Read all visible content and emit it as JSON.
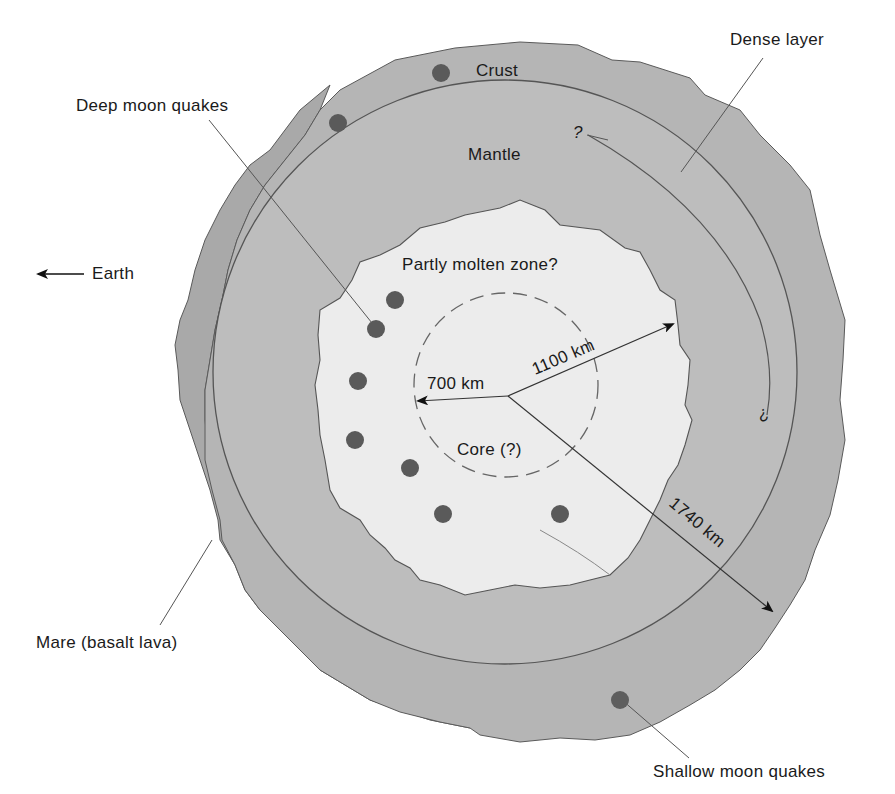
{
  "diagram": {
    "labels": {
      "crust": "Crust",
      "mantle": "Mantle",
      "dense_layer": "Dense layer",
      "deep_moon_quakes": "Deep moon quakes",
      "earth": "Earth",
      "partly_molten_zone": "Partly molten zone?",
      "core": "Core (?)",
      "mare": "Mare (basalt lava)",
      "shallow_moon_quakes": "Shallow moon quakes",
      "question_mark_top": "?",
      "question_mark_right": "?"
    },
    "radii": {
      "core": "700 km",
      "partly_molten_zone": "1100 km",
      "moon": "1740 km"
    },
    "colors": {
      "background": "#ffffff",
      "mare": "#a9a9a9",
      "crust": "#b5b5b5",
      "mantle": "#bdbdbd",
      "molten_zone": "#ececec",
      "quake_dot": "#5a5a5a",
      "outline": "#4a4a4a",
      "text": "#1a1a1a"
    },
    "quakes": {
      "deep_count": 7,
      "shallow_count": 3
    }
  }
}
